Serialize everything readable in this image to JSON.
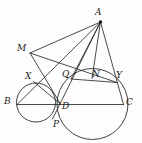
{
  "figure": {
    "type": "geometry-diagram",
    "stroke_color": "#2b2b2b",
    "background_color": "#fdfdfd",
    "width": 142,
    "height": 143,
    "points": [
      {
        "id": "A",
        "label": "A",
        "x": 100.5,
        "y": 22.0,
        "label_x": 95,
        "label_y": 8,
        "dot": true
      },
      {
        "id": "M",
        "label": "M",
        "x": 30.0,
        "y": 53.0,
        "label_x": 17,
        "label_y": 44,
        "dot": false
      },
      {
        "id": "X",
        "label": "X",
        "x": 33.5,
        "y": 81.5,
        "label_x": 25,
        "label_y": 72,
        "dot": false
      },
      {
        "id": "Q",
        "label": "Q",
        "x": 71.0,
        "y": 79.0,
        "label_x": 62,
        "label_y": 70,
        "dot": false
      },
      {
        "id": "N",
        "label": "N",
        "x": 92.0,
        "y": 78.5,
        "label_x": 92,
        "label_y": 70,
        "dot": false
      },
      {
        "id": "Y",
        "label": "Y",
        "x": 117.0,
        "y": 82.5,
        "label_x": 116,
        "label_y": 71,
        "dot": false
      },
      {
        "id": "B",
        "label": "B",
        "x": 17.0,
        "y": 104.5,
        "label_x": 4,
        "label_y": 97,
        "dot": false
      },
      {
        "id": "D",
        "label": "D",
        "x": 60.5,
        "y": 104.0,
        "label_x": 62,
        "label_y": 102,
        "dot": false
      },
      {
        "id": "C",
        "label": "C",
        "x": 123.5,
        "y": 104.5,
        "label_x": 126,
        "label_y": 98,
        "dot": false
      },
      {
        "id": "P",
        "label": "P",
        "x": 52.5,
        "y": 119.0,
        "label_x": 53,
        "label_y": 120,
        "dot": false
      }
    ],
    "circles": [
      {
        "id": "small-circle",
        "cx": 36.0,
        "cy": 102.5,
        "r": 19.5
      },
      {
        "id": "large-circle",
        "cx": 92.5,
        "cy": 104.0,
        "r": 35.5
      }
    ],
    "segments": [
      {
        "id": "AM",
        "from": "A",
        "to": "M"
      },
      {
        "id": "AB",
        "from": "A",
        "to": "B"
      },
      {
        "id": "AP",
        "from": "A",
        "to": "P"
      },
      {
        "id": "AQ",
        "from": "A",
        "to": "Q"
      },
      {
        "id": "AN",
        "from": "A",
        "to": "N"
      },
      {
        "id": "AC",
        "from": "A",
        "to": "C"
      },
      {
        "id": "BC",
        "from": "B",
        "to": "C"
      },
      {
        "id": "MD",
        "from": "M",
        "to": "D"
      },
      {
        "id": "MY",
        "from": "M",
        "to": "Y"
      },
      {
        "id": "QY",
        "from": "Q",
        "to": "Y"
      },
      {
        "id": "XD",
        "from": "X",
        "to": "D"
      }
    ]
  }
}
